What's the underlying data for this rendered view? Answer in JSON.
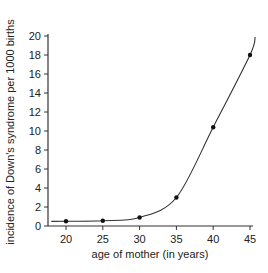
{
  "chart_data": {
    "type": "line",
    "title": "",
    "xlabel": "age of mother (in years)",
    "ylabel": "incidence of Down's syndrome per 1000 births",
    "x": [
      20,
      25,
      30,
      35,
      40,
      45
    ],
    "series": [
      {
        "name": "incidence",
        "values": [
          0.5,
          0.55,
          0.9,
          3.0,
          10.4,
          18.0
        ],
        "markers": true,
        "line": "smooth-fit"
      }
    ],
    "xlim": [
      18,
      45.5
    ],
    "ylim": [
      0,
      20
    ],
    "xticks": [
      20,
      25,
      30,
      35,
      40,
      45
    ],
    "yticks": [
      0,
      2,
      4,
      6,
      8,
      10,
      12,
      14,
      16,
      18,
      20
    ],
    "grid": false,
    "legend": "none",
    "colors": {
      "line": "#333333",
      "marker": "#111111",
      "axis": "#333333"
    }
  }
}
